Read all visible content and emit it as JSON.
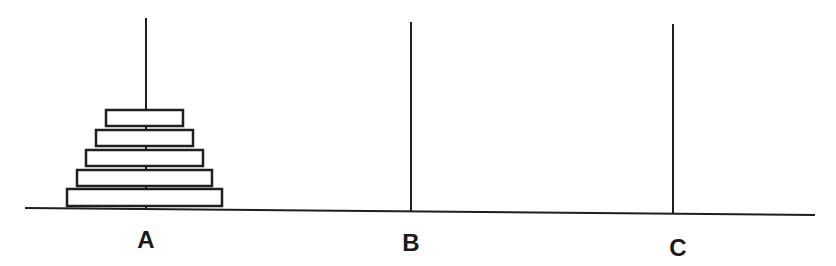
{
  "colors": {
    "stroke": "#1f1f1f",
    "disk_fill": "#ffffff",
    "background": "#ffffff"
  },
  "base": {
    "x1": 25,
    "y1": 208,
    "x2": 815,
    "y2": 215
  },
  "pegs": [
    {
      "label": "A",
      "x": 146,
      "top": 18,
      "bottom": 210,
      "label_x": 146,
      "label_y": 248
    },
    {
      "label": "B",
      "x": 411,
      "top": 22,
      "bottom": 212,
      "label_x": 411,
      "label_y": 251
    },
    {
      "label": "C",
      "x": 673,
      "top": 24,
      "bottom": 214,
      "label_x": 678,
      "label_y": 256
    }
  ],
  "disks": [
    {
      "peg": "A",
      "size": 1,
      "x": 106,
      "y": 110,
      "w": 77,
      "h": 16
    },
    {
      "peg": "A",
      "size": 2,
      "x": 96,
      "y": 130,
      "w": 97,
      "h": 16
    },
    {
      "peg": "A",
      "size": 3,
      "x": 86,
      "y": 150,
      "w": 117,
      "h": 16
    },
    {
      "peg": "A",
      "size": 4,
      "x": 77,
      "y": 170,
      "w": 135,
      "h": 16
    },
    {
      "peg": "A",
      "size": 5,
      "x": 67,
      "y": 189,
      "w": 155,
      "h": 17
    }
  ]
}
